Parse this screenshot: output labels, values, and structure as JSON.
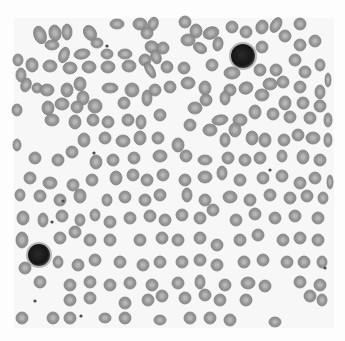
{
  "image": {
    "subject": "blood smear micrograph",
    "width": 345,
    "height": 341,
    "background": "#fdfdfd",
    "field": {
      "x": 14,
      "y": 18,
      "w": 320,
      "h": 310,
      "color": "#f7f7f7"
    },
    "rbc_color": "#9a9a9a",
    "rbc_center_color": "#b8b8b8",
    "rbc_edge_color": "#7d7d7d",
    "nucleus_color": "#1c1c1c",
    "halo_color": "#8a8a8a"
  },
  "leukocytes": [
    {
      "name": "lymphocyte-upper-right",
      "cx": 243,
      "cy": 56,
      "r": 12
    },
    {
      "name": "lymphocyte-lower-left",
      "cx": 39,
      "cy": 255,
      "r": 11
    }
  ],
  "platelets": [
    {
      "cx": 107,
      "cy": 46
    },
    {
      "cx": 94,
      "cy": 153
    },
    {
      "cx": 63,
      "cy": 201
    },
    {
      "cx": 35,
      "cy": 301
    },
    {
      "cx": 81,
      "cy": 316
    },
    {
      "cx": 52,
      "cy": 222
    },
    {
      "cx": 270,
      "cy": 170
    },
    {
      "cx": 325,
      "cy": 268
    }
  ],
  "rbcs": [
    [
      40,
      35,
      6,
      9,
      -20
    ],
    [
      55,
      33,
      6,
      8,
      -10
    ],
    [
      67,
      32,
      5,
      8,
      0
    ],
    [
      90,
      33,
      6,
      8,
      -30
    ],
    [
      117,
      24,
      7,
      5,
      0
    ],
    [
      140,
      24,
      7,
      6,
      0
    ],
    [
      153,
      24,
      5,
      7,
      20
    ],
    [
      185,
      22,
      6,
      6,
      0
    ],
    [
      196,
      31,
      6,
      7,
      0
    ],
    [
      211,
      33,
      8,
      6,
      -20
    ],
    [
      232,
      27,
      6,
      6,
      0
    ],
    [
      246,
      32,
      6,
      6,
      0
    ],
    [
      262,
      27,
      6,
      7,
      20
    ],
    [
      276,
      25,
      5,
      8,
      30
    ],
    [
      300,
      24,
      6,
      6,
      0
    ],
    [
      52,
      45,
      7,
      5,
      0
    ],
    [
      97,
      43,
      6,
      5,
      0
    ],
    [
      147,
      33,
      6,
      6,
      0
    ],
    [
      152,
      47,
      7,
      6,
      20
    ],
    [
      188,
      40,
      7,
      6,
      0
    ],
    [
      200,
      48,
      7,
      5,
      30
    ],
    [
      218,
      44,
      5,
      7,
      10
    ],
    [
      262,
      47,
      6,
      6,
      0
    ],
    [
      285,
      36,
      6,
      6,
      0
    ],
    [
      300,
      45,
      6,
      6,
      0
    ],
    [
      315,
      41,
      6,
      6,
      0
    ],
    [
      64,
      55,
      5,
      8,
      20
    ],
    [
      82,
      54,
      8,
      5,
      -10
    ],
    [
      107,
      54,
      6,
      5,
      0
    ],
    [
      125,
      54,
      7,
      5,
      0
    ],
    [
      145,
      60,
      6,
      6,
      0
    ],
    [
      156,
      57,
      5,
      7,
      -20
    ],
    [
      163,
      48,
      6,
      6,
      0
    ],
    [
      18,
      60,
      5,
      6,
      0
    ],
    [
      21,
      75,
      5,
      7,
      0
    ],
    [
      32,
      65,
      6,
      7,
      -10
    ],
    [
      50,
      66,
      7,
      6,
      0
    ],
    [
      70,
      68,
      7,
      6,
      0
    ],
    [
      89,
      67,
      7,
      6,
      0
    ],
    [
      108,
      67,
      7,
      6,
      0
    ],
    [
      129,
      66,
      7,
      6,
      0
    ],
    [
      150,
      70,
      4,
      9,
      -30
    ],
    [
      167,
      67,
      6,
      6,
      0
    ],
    [
      184,
      68,
      6,
      6,
      0
    ],
    [
      212,
      65,
      6,
      6,
      0
    ],
    [
      232,
      73,
      8,
      6,
      0
    ],
    [
      260,
      70,
      6,
      6,
      0
    ],
    [
      276,
      70,
      6,
      6,
      0
    ],
    [
      295,
      60,
      6,
      6,
      0
    ],
    [
      305,
      72,
      6,
      6,
      0
    ],
    [
      320,
      65,
      5,
      6,
      0
    ],
    [
      328,
      80,
      3,
      7,
      0
    ],
    [
      26,
      85,
      5,
      7,
      20
    ],
    [
      37,
      88,
      5,
      5,
      0
    ],
    [
      47,
      90,
      7,
      6,
      0
    ],
    [
      67,
      90,
      6,
      7,
      0
    ],
    [
      80,
      84,
      6,
      7,
      0
    ],
    [
      83,
      98,
      6,
      7,
      0
    ],
    [
      110,
      88,
      8,
      5,
      0
    ],
    [
      132,
      90,
      7,
      7,
      0
    ],
    [
      155,
      90,
      6,
      6,
      0
    ],
    [
      170,
      87,
      6,
      6,
      0
    ],
    [
      188,
      83,
      7,
      6,
      0
    ],
    [
      205,
      88,
      6,
      7,
      0
    ],
    [
      230,
      90,
      6,
      6,
      0
    ],
    [
      246,
      88,
      7,
      6,
      -20
    ],
    [
      270,
      84,
      7,
      6,
      0
    ],
    [
      283,
      82,
      6,
      6,
      0
    ],
    [
      300,
      87,
      6,
      6,
      0
    ],
    [
      320,
      92,
      5,
      7,
      0
    ],
    [
      17,
      110,
      5,
      6,
      0
    ],
    [
      48,
      108,
      6,
      7,
      0
    ],
    [
      62,
      104,
      7,
      6,
      0
    ],
    [
      77,
      107,
      6,
      6,
      0
    ],
    [
      95,
      106,
      7,
      7,
      0
    ],
    [
      124,
      103,
      6,
      6,
      0
    ],
    [
      147,
      98,
      5,
      8,
      0
    ],
    [
      195,
      108,
      7,
      6,
      0
    ],
    [
      206,
      100,
      6,
      6,
      0
    ],
    [
      225,
      98,
      5,
      7,
      0
    ],
    [
      262,
      95,
      7,
      6,
      0
    ],
    [
      285,
      103,
      6,
      7,
      0
    ],
    [
      303,
      103,
      6,
      6,
      0
    ],
    [
      320,
      106,
      6,
      6,
      0
    ],
    [
      52,
      120,
      7,
      6,
      0
    ],
    [
      75,
      122,
      6,
      7,
      0
    ],
    [
      93,
      120,
      6,
      6,
      0
    ],
    [
      108,
      122,
      6,
      6,
      0
    ],
    [
      128,
      120,
      6,
      6,
      0
    ],
    [
      141,
      122,
      5,
      7,
      0
    ],
    [
      160,
      115,
      6,
      6,
      0
    ],
    [
      190,
      125,
      6,
      6,
      0
    ],
    [
      220,
      120,
      8,
      5,
      -10
    ],
    [
      240,
      120,
      7,
      6,
      0
    ],
    [
      255,
      112,
      6,
      7,
      0
    ],
    [
      273,
      114,
      6,
      6,
      0
    ],
    [
      290,
      117,
      6,
      6,
      0
    ],
    [
      310,
      118,
      6,
      6,
      0
    ],
    [
      328,
      120,
      4,
      7,
      0
    ],
    [
      84,
      140,
      6,
      7,
      0
    ],
    [
      105,
      138,
      6,
      6,
      0
    ],
    [
      123,
      141,
      7,
      6,
      0
    ],
    [
      140,
      138,
      6,
      7,
      0
    ],
    [
      158,
      138,
      6,
      6,
      0
    ],
    [
      178,
      145,
      6,
      7,
      0
    ],
    [
      210,
      130,
      7,
      6,
      0
    ],
    [
      225,
      140,
      5,
      7,
      0
    ],
    [
      235,
      130,
      6,
      7,
      0
    ],
    [
      252,
      138,
      6,
      7,
      0
    ],
    [
      265,
      140,
      6,
      7,
      0
    ],
    [
      284,
      140,
      6,
      6,
      0
    ],
    [
      298,
      135,
      6,
      6,
      0
    ],
    [
      313,
      138,
      7,
      6,
      0
    ],
    [
      328,
      140,
      4,
      7,
      0
    ],
    [
      17,
      145,
      4,
      6,
      0
    ],
    [
      35,
      158,
      6,
      6,
      0
    ],
    [
      58,
      160,
      6,
      6,
      0
    ],
    [
      72,
      152,
      6,
      6,
      0
    ],
    [
      96,
      162,
      6,
      7,
      0
    ],
    [
      113,
      160,
      6,
      6,
      0
    ],
    [
      134,
      158,
      6,
      6,
      0
    ],
    [
      160,
      156,
      7,
      6,
      0
    ],
    [
      186,
      156,
      6,
      6,
      0
    ],
    [
      205,
      160,
      7,
      5,
      0
    ],
    [
      228,
      158,
      6,
      6,
      0
    ],
    [
      245,
      160,
      6,
      6,
      0
    ],
    [
      260,
      158,
      6,
      6,
      0
    ],
    [
      282,
      156,
      5,
      6,
      0
    ],
    [
      303,
      157,
      6,
      7,
      0
    ],
    [
      320,
      160,
      6,
      6,
      0
    ],
    [
      30,
      178,
      6,
      6,
      0
    ],
    [
      50,
      183,
      7,
      6,
      0
    ],
    [
      73,
      185,
      6,
      6,
      0
    ],
    [
      92,
      180,
      6,
      6,
      0
    ],
    [
      116,
      178,
      6,
      7,
      0
    ],
    [
      133,
      175,
      6,
      6,
      0
    ],
    [
      147,
      180,
      6,
      6,
      0
    ],
    [
      163,
      175,
      6,
      6,
      0
    ],
    [
      185,
      180,
      6,
      6,
      0
    ],
    [
      205,
      177,
      7,
      6,
      0
    ],
    [
      222,
      173,
      5,
      7,
      0
    ],
    [
      240,
      180,
      6,
      6,
      0
    ],
    [
      263,
      178,
      6,
      6,
      0
    ],
    [
      282,
      176,
      6,
      6,
      0
    ],
    [
      300,
      183,
      6,
      6,
      0
    ],
    [
      315,
      178,
      6,
      6,
      0
    ],
    [
      330,
      182,
      3,
      7,
      0
    ],
    [
      20,
      195,
      5,
      6,
      0
    ],
    [
      40,
      196,
      6,
      6,
      0
    ],
    [
      60,
      200,
      6,
      6,
      0
    ],
    [
      80,
      196,
      6,
      7,
      0
    ],
    [
      107,
      200,
      5,
      6,
      0
    ],
    [
      125,
      197,
      6,
      6,
      0
    ],
    [
      145,
      200,
      6,
      6,
      0
    ],
    [
      160,
      195,
      6,
      6,
      0
    ],
    [
      187,
      195,
      5,
      7,
      0
    ],
    [
      205,
      200,
      6,
      6,
      0
    ],
    [
      230,
      197,
      7,
      6,
      0
    ],
    [
      250,
      200,
      6,
      6,
      0
    ],
    [
      270,
      195,
      6,
      6,
      0
    ],
    [
      290,
      198,
      6,
      6,
      0
    ],
    [
      307,
      196,
      6,
      6,
      0
    ],
    [
      323,
      198,
      5,
      6,
      0
    ],
    [
      23,
      218,
      6,
      7,
      0
    ],
    [
      43,
      220,
      5,
      7,
      0
    ],
    [
      62,
      216,
      6,
      6,
      0
    ],
    [
      80,
      220,
      5,
      6,
      0
    ],
    [
      95,
      215,
      5,
      6,
      0
    ],
    [
      110,
      222,
      6,
      6,
      0
    ],
    [
      130,
      218,
      6,
      6,
      0
    ],
    [
      150,
      216,
      6,
      6,
      0
    ],
    [
      165,
      220,
      6,
      6,
      0
    ],
    [
      182,
      215,
      6,
      6,
      0
    ],
    [
      200,
      218,
      6,
      6,
      0
    ],
    [
      213,
      210,
      6,
      6,
      0
    ],
    [
      236,
      220,
      6,
      6,
      0
    ],
    [
      255,
      214,
      6,
      6,
      0
    ],
    [
      275,
      218,
      6,
      6,
      0
    ],
    [
      295,
      216,
      6,
      6,
      0
    ],
    [
      318,
      218,
      6,
      6,
      0
    ],
    [
      22,
      240,
      6,
      8,
      0
    ],
    [
      60,
      238,
      6,
      6,
      0
    ],
    [
      75,
      232,
      6,
      6,
      0
    ],
    [
      90,
      240,
      6,
      6,
      0
    ],
    [
      110,
      240,
      6,
      6,
      0
    ],
    [
      140,
      240,
      6,
      6,
      0
    ],
    [
      162,
      238,
      6,
      6,
      0
    ],
    [
      178,
      240,
      6,
      6,
      0
    ],
    [
      200,
      238,
      6,
      6,
      0
    ],
    [
      217,
      245,
      6,
      6,
      0
    ],
    [
      240,
      240,
      6,
      6,
      0
    ],
    [
      258,
      235,
      6,
      6,
      0
    ],
    [
      283,
      240,
      6,
      6,
      0
    ],
    [
      300,
      238,
      6,
      6,
      0
    ],
    [
      318,
      240,
      6,
      6,
      0
    ],
    [
      25,
      268,
      6,
      6,
      0
    ],
    [
      58,
      262,
      5,
      6,
      0
    ],
    [
      78,
      265,
      6,
      6,
      0
    ],
    [
      95,
      260,
      6,
      6,
      0
    ],
    [
      120,
      262,
      6,
      6,
      0
    ],
    [
      143,
      265,
      6,
      6,
      0
    ],
    [
      160,
      262,
      6,
      6,
      0
    ],
    [
      182,
      262,
      6,
      6,
      0
    ],
    [
      200,
      260,
      6,
      6,
      0
    ],
    [
      217,
      265,
      6,
      6,
      0
    ],
    [
      244,
      262,
      6,
      6,
      0
    ],
    [
      263,
      260,
      6,
      6,
      0
    ],
    [
      287,
      262,
      6,
      6,
      0
    ],
    [
      304,
      262,
      6,
      6,
      0
    ],
    [
      322,
      262,
      5,
      6,
      0
    ],
    [
      40,
      282,
      6,
      6,
      0
    ],
    [
      70,
      285,
      6,
      6,
      0
    ],
    [
      90,
      282,
      6,
      6,
      0
    ],
    [
      110,
      285,
      6,
      6,
      0
    ],
    [
      130,
      283,
      6,
      6,
      0
    ],
    [
      152,
      285,
      6,
      6,
      0
    ],
    [
      178,
      283,
      6,
      6,
      0
    ],
    [
      200,
      282,
      5,
      7,
      0
    ],
    [
      225,
      285,
      6,
      6,
      0
    ],
    [
      248,
      283,
      7,
      6,
      0
    ],
    [
      265,
      286,
      6,
      6,
      0
    ],
    [
      300,
      282,
      6,
      6,
      0
    ],
    [
      320,
      285,
      6,
      6,
      0
    ],
    [
      70,
      300,
      6,
      6,
      0
    ],
    [
      90,
      298,
      6,
      6,
      0
    ],
    [
      125,
      303,
      6,
      6,
      0
    ],
    [
      148,
      300,
      6,
      6,
      0
    ],
    [
      162,
      296,
      6,
      6,
      0
    ],
    [
      185,
      298,
      6,
      6,
      0
    ],
    [
      205,
      295,
      6,
      6,
      0
    ],
    [
      220,
      300,
      6,
      6,
      0
    ],
    [
      246,
      300,
      6,
      6,
      0
    ],
    [
      310,
      296,
      6,
      6,
      0
    ],
    [
      322,
      300,
      5,
      6,
      0
    ],
    [
      22,
      318,
      6,
      6,
      0
    ],
    [
      53,
      318,
      6,
      6,
      0
    ],
    [
      70,
      318,
      6,
      6,
      0
    ],
    [
      105,
      318,
      6,
      5,
      0
    ],
    [
      125,
      318,
      6,
      6,
      0
    ],
    [
      160,
      320,
      6,
      5,
      0
    ],
    [
      190,
      318,
      6,
      6,
      0
    ],
    [
      210,
      318,
      6,
      6,
      0
    ],
    [
      230,
      320,
      6,
      6,
      0
    ],
    [
      275,
      322,
      6,
      5,
      0
    ]
  ]
}
